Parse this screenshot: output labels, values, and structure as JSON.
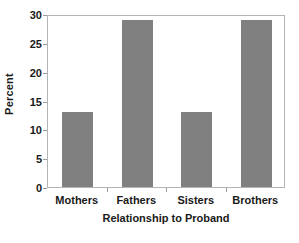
{
  "chart_data": {
    "type": "bar",
    "title": "",
    "subtitle": "",
    "categories": [
      "Mothers",
      "Fathers",
      "Sisters",
      "Brothers"
    ],
    "values": [
      13,
      29,
      13,
      29
    ],
    "xlabel": "Relationship to Proband",
    "ylabel": "Percent",
    "ylim": [
      0,
      30
    ],
    "yticks": [
      0,
      5,
      10,
      15,
      20,
      25,
      30
    ],
    "ytick_labels": [
      "0",
      "5",
      "10",
      "15",
      "20",
      "25",
      "30"
    ],
    "grid": false,
    "legend": null,
    "annotations": [],
    "colors": {
      "bar_fill": "#808080",
      "axis_line": "#b4b4b4",
      "tick_mark": "#9a9a9a",
      "text": "#1a1a1a",
      "background": "#ffffff"
    }
  }
}
